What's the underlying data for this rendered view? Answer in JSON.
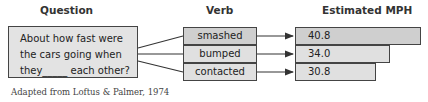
{
  "headers": {
    "question": "Question",
    "verb": "Verb",
    "estimate": "Estimated MPH"
  },
  "question": {
    "lines": [
      "About how fast were",
      "the cars going when",
      "they_____ each other?"
    ]
  },
  "rows": [
    {
      "verb": "smashed",
      "mph": "40.8",
      "mph_value": 40.8,
      "fill": "#cfcfcf"
    },
    {
      "verb": "bumped",
      "mph": "34.0",
      "mph_value": 34.0,
      "fill": "#e0e0e0"
    },
    {
      "verb": "contacted",
      "mph": "30.8",
      "mph_value": 30.8,
      "fill": "#e0e0e0"
    }
  ],
  "caption": "Adapted from Loftus & Palmer, 1974",
  "colors": {
    "stroke": "#444444",
    "question_fill": "#e3e3e3"
  }
}
